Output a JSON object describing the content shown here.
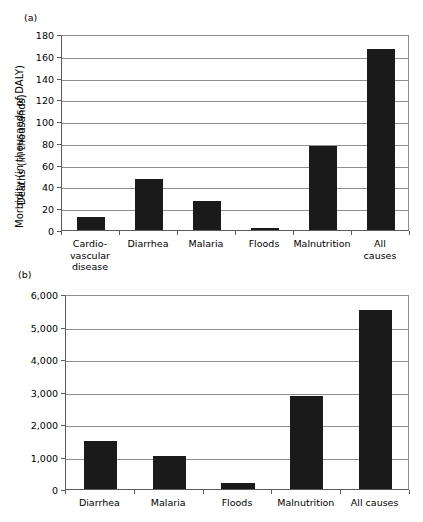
{
  "figure": {
    "panels": [
      {
        "id": "a",
        "label": "(a)"
      },
      {
        "id": "b",
        "label": "(b)"
      }
    ]
  },
  "chart_data": [
    {
      "panel": "(a)",
      "type": "bar",
      "title": "",
      "xlabel": "",
      "ylabel": "Deaths (in thousands)",
      "categories": [
        "Cardio-\nvascular\ndisease",
        "Diarrhea",
        "Malaria",
        "Floods",
        "Malnutrition",
        "All causes"
      ],
      "values": [
        12,
        46.5,
        27,
        2,
        77,
        166
      ],
      "ylim": [
        0,
        180
      ],
      "yticks": [
        0,
        20,
        40,
        60,
        80,
        100,
        120,
        140,
        160,
        180
      ],
      "ytick_labels": [
        "0",
        "20",
        "40",
        "60",
        "80",
        "100",
        "120",
        "140",
        "160",
        "180"
      ],
      "grid": true,
      "legend": "none",
      "bar_color": "#1a1a1a"
    },
    {
      "panel": "(b)",
      "type": "bar",
      "title": "",
      "xlabel": "",
      "ylabel": "Morbidity (in thousands of DALY)",
      "categories": [
        "Diarrhea",
        "Malaria",
        "Floods",
        "Malnutrition",
        "All causes"
      ],
      "values": [
        1470,
        1010,
        190,
        2860,
        5520
      ],
      "ylim": [
        0,
        6000
      ],
      "yticks": [
        0,
        1000,
        2000,
        3000,
        4000,
        5000,
        6000
      ],
      "ytick_labels": [
        "0",
        "1,000",
        "2,000",
        "3,000",
        "4,000",
        "5,000",
        "6,000"
      ],
      "grid": true,
      "legend": "none",
      "bar_color": "#1a1a1a"
    }
  ]
}
